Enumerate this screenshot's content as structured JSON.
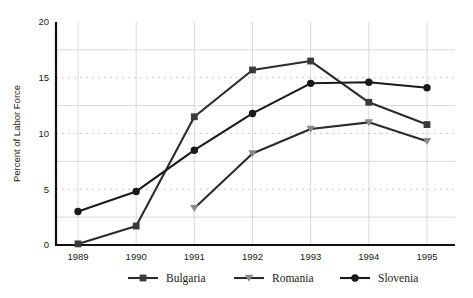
{
  "chart_data": {
    "type": "line",
    "title": "",
    "xlabel": "",
    "ylabel": "Percent of Labor Force",
    "categories": [
      "1989",
      "1990",
      "1991",
      "1992",
      "1993",
      "1994",
      "1995"
    ],
    "x": [
      1989,
      1990,
      1991,
      1992,
      1993,
      1994,
      1995
    ],
    "ylim": [
      0,
      20
    ],
    "yticks": [
      0,
      5,
      10,
      15,
      20
    ],
    "ytick_labels": [
      "0",
      "5",
      "10",
      "15",
      "20"
    ],
    "grid": true,
    "grid_solid_values": [
      2.5,
      7.5,
      12.5,
      17.5
    ],
    "grid_dotted_values": [
      5,
      10,
      15
    ],
    "legend_position": "bottom",
    "series": [
      {
        "name": "Bulgaria",
        "marker": "square",
        "color": "#2b2b2b",
        "marker_color": "#3a3a3a",
        "values": [
          0.1,
          1.7,
          11.5,
          15.7,
          16.5,
          12.8,
          10.8
        ]
      },
      {
        "name": "Romania",
        "marker": "triangle-down",
        "color": "#2b2b2b",
        "marker_color": "#8a8a8a",
        "values": [
          null,
          null,
          3.3,
          8.2,
          10.4,
          11.0,
          9.3
        ]
      },
      {
        "name": "Slovenia",
        "marker": "circle",
        "color": "#1a1a1a",
        "marker_color": "#1a1a1a",
        "values": [
          3.0,
          4.8,
          8.5,
          11.8,
          14.5,
          14.6,
          14.1
        ]
      }
    ]
  },
  "legend": {
    "items": [
      {
        "label": "Bulgaria"
      },
      {
        "label": "Romania"
      },
      {
        "label": "Slovenia"
      }
    ]
  }
}
